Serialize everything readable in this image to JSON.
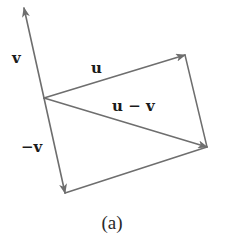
{
  "figure": {
    "caption": "(a)",
    "colors": {
      "line": "#6e6e6e",
      "arrowhead": "#6e6e6e",
      "text": "#1a1a1a",
      "background": "#ffffff"
    },
    "vectors": [
      {
        "id": "v",
        "label": "v",
        "tail": [
          44,
          98
        ],
        "head": [
          24,
          8
        ]
      },
      {
        "id": "u",
        "label": "u",
        "tail": [
          44,
          98
        ],
        "head": [
          185,
          55
        ]
      },
      {
        "id": "u-minus-v",
        "label": "u − v",
        "tail": [
          44,
          98
        ],
        "head": [
          207,
          147
        ]
      },
      {
        "id": "neg-v",
        "label": "−v",
        "tail": [
          44,
          98
        ],
        "head": [
          65,
          193
        ]
      }
    ],
    "edges": [
      {
        "id": "u-head-to-uv-head",
        "from": [
          185,
          55
        ],
        "to": [
          207,
          147
        ]
      },
      {
        "id": "negv-head-to-uv-head",
        "from": [
          65,
          193
        ],
        "to": [
          207,
          147
        ]
      }
    ],
    "labels": {
      "v": "v",
      "u": "u",
      "u_minus_v": "u − v",
      "neg_v": "−v"
    }
  }
}
